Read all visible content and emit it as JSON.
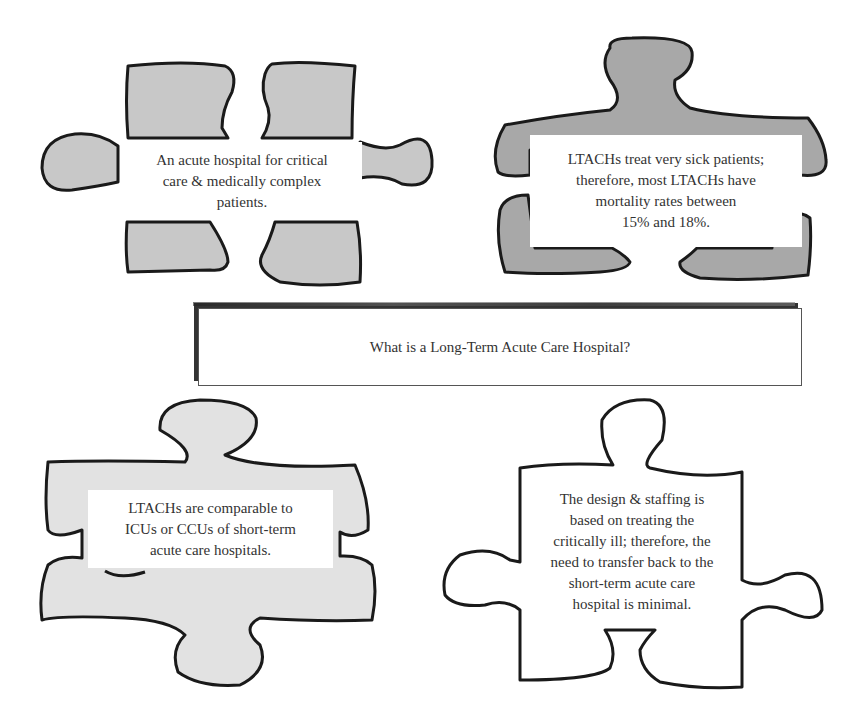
{
  "title": "What is a Long-Term Acute Care Hospital?",
  "pieces": [
    {
      "id": "top-left",
      "text_lines": [
        "An acute hospital for critical",
        "care & medically complex",
        "patients."
      ],
      "fill": "#c8c8c8"
    },
    {
      "id": "top-right",
      "text_lines": [
        "LTACHs treat very sick patients;",
        "therefore, most LTACHs have",
        "mortality rates between",
        "15% and 18%."
      ],
      "fill": "#a8a8a8"
    },
    {
      "id": "bottom-left",
      "text_lines": [
        "LTACHs are comparable to",
        "ICUs or CCUs of short-term",
        "acute care hospitals."
      ],
      "fill": "#e2e2e2"
    },
    {
      "id": "bottom-right",
      "text_lines": [
        "The design & staffing is",
        "based on treating the",
        "critically ill; therefore, the",
        "need to transfer back to the",
        "short-term acute care",
        "hospital is minimal."
      ],
      "fill": "#ffffff"
    }
  ],
  "colors": {
    "outline": "#1a1a1a",
    "text": "#333333",
    "background": "#ffffff"
  }
}
